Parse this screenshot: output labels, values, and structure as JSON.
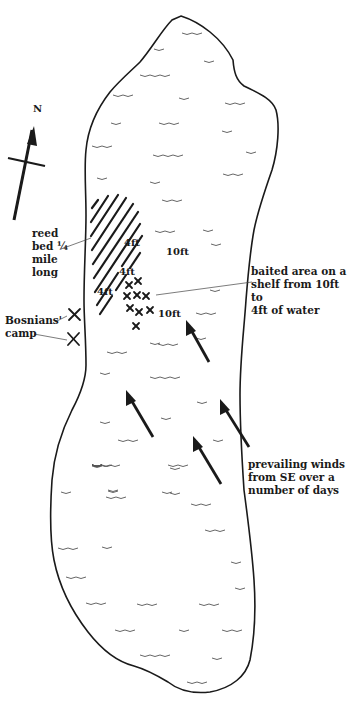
{
  "map": {
    "title": "Lake swim map",
    "compass": {
      "label": "N",
      "icon": "north-arrow-icon"
    },
    "colors": {
      "ink": "#1a1a1a",
      "background": "#ffffff",
      "waves": "#555555"
    },
    "labels": {
      "reed_bed": "reed\nbed ¼\nmile\nlong",
      "camp": "Bosnians'\ncamp",
      "baited_area": "baited area on a\nshelf from 10ft to\n4ft of water",
      "winds": "prevailing winds\nfrom SE over a\nnumber of days"
    },
    "depths": [
      {
        "text": "4ft",
        "x": 124,
        "y": 237
      },
      {
        "text": "10ft",
        "x": 166,
        "y": 246
      },
      {
        "text": "4ft",
        "x": 119,
        "y": 266
      },
      {
        "text": "4ft",
        "x": 97,
        "y": 286
      },
      {
        "text": "10ft",
        "x": 158,
        "y": 308
      }
    ],
    "markers": {
      "camp_crosses": 2,
      "bait_crosses": 9
    },
    "wind_arrows": 4,
    "wind_direction": "SE"
  }
}
